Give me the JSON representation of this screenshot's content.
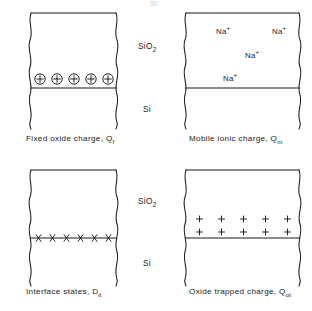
{
  "figure": {
    "title_clipped": "Si",
    "layer_labels": {
      "oxide": "SiO",
      "oxide_sub": "2",
      "semiconductor": "Si"
    },
    "panels": [
      {
        "id": "fixed-oxide-charge",
        "caption_text": "Fixed oxide charge, Q",
        "caption_sub": "f",
        "charge_symbol": "circled-plus",
        "charge_count": 5,
        "charge_placement": "on-interface",
        "rows": 1
      },
      {
        "id": "mobile-ionic-charge",
        "caption_text": "Mobile ionic charge, Q",
        "caption_sub": "m",
        "charge_symbol": "sodium-ion-label",
        "ion_text": "Na",
        "ion_sup": "+",
        "charge_count": 4,
        "charge_placement": "distributed-in-oxide",
        "ion_positions": [
          {
            "x": 31,
            "y": 19
          },
          {
            "x": 89,
            "y": 19
          },
          {
            "x": 63,
            "y": 43
          },
          {
            "x": 41,
            "y": 66
          }
        ]
      },
      {
        "id": "interface-states",
        "caption_text": "Interface states, D",
        "caption_sub": "it",
        "charge_symbol": "cross",
        "charge_count": 6,
        "charge_placement": "on-interface",
        "rows": 1
      },
      {
        "id": "oxide-trapped-charge",
        "caption_text": "Oxide trapped charge, Q",
        "caption_sub": "ot",
        "charge_symbol": "plus",
        "charge_count": 10,
        "charge_placement": "two-rows-above-interface",
        "rows": 2,
        "per_row": 5
      }
    ],
    "colors": {
      "stroke": "#1a1a1a",
      "background": "#ffffff"
    }
  }
}
